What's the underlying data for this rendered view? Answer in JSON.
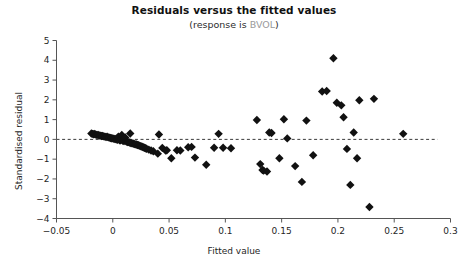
{
  "chart_data": {
    "type": "scatter",
    "title": "Residuals versus the fitted values",
    "subtitle_prefix": "(response is ",
    "subtitle_variable": "BVOL",
    "subtitle_suffix": ")",
    "xlabel": "Fitted value",
    "ylabel": "Standardised residual",
    "xlim": [
      -0.05,
      0.3
    ],
    "ylim": [
      -4,
      5
    ],
    "xticks": [
      -0.05,
      0,
      0.05,
      0.1,
      0.15,
      0.2,
      0.25,
      0.3
    ],
    "xticklabels": [
      "−0.05",
      "0",
      "0.05",
      "0.1",
      "0.15",
      "0.2",
      "0.25",
      "0.3"
    ],
    "yticks": [
      -4,
      -3,
      -2,
      -1,
      0,
      1,
      2,
      3,
      4,
      5
    ],
    "yticklabels": [
      "−4",
      "−3",
      "−2",
      "−1",
      "0",
      "1",
      "2",
      "3",
      "4",
      "5"
    ],
    "grid": false,
    "legend": false,
    "reference_line": {
      "orientation": "horizontal",
      "y": 0,
      "style": "dashed"
    },
    "marker": {
      "shape": "diamond",
      "color": "#111111",
      "size": 4.2
    },
    "point_count": 83,
    "points": [
      [
        -0.019,
        0.3
      ],
      [
        -0.018,
        0.28
      ],
      [
        -0.017,
        0.26
      ],
      [
        -0.016,
        0.27
      ],
      [
        -0.015,
        0.24
      ],
      [
        -0.014,
        0.22
      ],
      [
        -0.013,
        0.23
      ],
      [
        -0.012,
        0.2
      ],
      [
        -0.011,
        0.19
      ],
      [
        -0.01,
        0.17
      ],
      [
        -0.009,
        0.18
      ],
      [
        -0.008,
        0.15
      ],
      [
        -0.007,
        0.14
      ],
      [
        -0.006,
        0.12
      ],
      [
        -0.005,
        0.13
      ],
      [
        -0.004,
        0.1
      ],
      [
        -0.003,
        0.09
      ],
      [
        -0.002,
        0.07
      ],
      [
        -0.001,
        0.06
      ],
      [
        0.0,
        0.05
      ],
      [
        0.001,
        0.03
      ],
      [
        0.002,
        0.02
      ],
      [
        0.003,
        0.0
      ],
      [
        0.004,
        -0.02
      ],
      [
        0.005,
        0.14
      ],
      [
        0.006,
        -0.04
      ],
      [
        0.007,
        -0.05
      ],
      [
        0.008,
        0.22
      ],
      [
        0.009,
        -0.07
      ],
      [
        0.01,
        -0.09
      ],
      [
        0.011,
        0.1
      ],
      [
        0.012,
        -0.11
      ],
      [
        0.013,
        -0.13
      ],
      [
        0.014,
        -0.14
      ],
      [
        0.015,
        -0.16
      ],
      [
        0.0155,
        0.3
      ],
      [
        0.016,
        -0.18
      ],
      [
        0.017,
        -0.2
      ],
      [
        0.018,
        -0.21
      ],
      [
        0.019,
        -0.23
      ],
      [
        0.02,
        -0.25
      ],
      [
        0.021,
        -0.26
      ],
      [
        0.022,
        -0.28
      ],
      [
        0.023,
        -0.3
      ],
      [
        0.024,
        -0.33
      ],
      [
        0.025,
        -0.35
      ],
      [
        0.026,
        -0.37
      ],
      [
        0.027,
        -0.4
      ],
      [
        0.028,
        -0.42
      ],
      [
        0.029,
        -0.45
      ],
      [
        0.03,
        -0.47
      ],
      [
        0.032,
        -0.52
      ],
      [
        0.034,
        -0.56
      ],
      [
        0.036,
        -0.6
      ],
      [
        0.04,
        -0.72
      ],
      [
        0.041,
        0.25
      ],
      [
        0.044,
        -0.43
      ],
      [
        0.047,
        -0.57
      ],
      [
        0.048,
        -0.55
      ],
      [
        0.052,
        -0.95
      ],
      [
        0.057,
        -0.55
      ],
      [
        0.06,
        -0.56
      ],
      [
        0.067,
        -0.4
      ],
      [
        0.07,
        -0.38
      ],
      [
        0.073,
        -0.92
      ],
      [
        0.083,
        -1.28
      ],
      [
        0.09,
        -0.42
      ],
      [
        0.094,
        0.28
      ],
      [
        0.098,
        -0.42
      ],
      [
        0.105,
        -0.45
      ],
      [
        0.128,
        0.98
      ],
      [
        0.131,
        -1.25
      ],
      [
        0.133,
        -1.55
      ],
      [
        0.134,
        -1.58
      ],
      [
        0.137,
        -1.62
      ],
      [
        0.139,
        0.35
      ],
      [
        0.141,
        0.32
      ],
      [
        0.148,
        -0.95
      ],
      [
        0.152,
        1.02
      ],
      [
        0.155,
        0.05
      ],
      [
        0.162,
        -1.35
      ],
      [
        0.168,
        -2.15
      ],
      [
        0.172,
        0.95
      ],
      [
        0.178,
        -0.8
      ],
      [
        0.186,
        2.42
      ],
      [
        0.19,
        2.45
      ],
      [
        0.196,
        4.1
      ],
      [
        0.199,
        1.85
      ],
      [
        0.203,
        1.72
      ],
      [
        0.205,
        1.12
      ],
      [
        0.208,
        -0.48
      ],
      [
        0.211,
        -2.3
      ],
      [
        0.214,
        0.35
      ],
      [
        0.217,
        -0.95
      ],
      [
        0.219,
        1.98
      ],
      [
        0.228,
        -3.42
      ],
      [
        0.232,
        2.05
      ],
      [
        0.258,
        0.28
      ]
    ]
  }
}
